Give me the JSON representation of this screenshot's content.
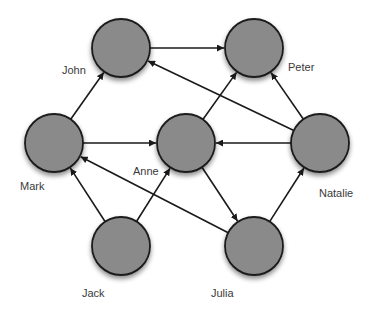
{
  "diagram": {
    "type": "directed-graph",
    "node_radius": 29,
    "colors": {
      "node_fill": "#8a8a8a",
      "node_stroke": "#1a1a1a",
      "edge": "#1a1a1a",
      "label": "#3a3a3a",
      "background": "#ffffff"
    },
    "nodes": [
      {
        "id": "john",
        "label": "John",
        "cx": 121,
        "cy": 48,
        "lx": 62,
        "ly": 74
      },
      {
        "id": "peter",
        "label": "Peter",
        "cx": 254,
        "cy": 48,
        "lx": 288,
        "ly": 71
      },
      {
        "id": "mark",
        "label": "Mark",
        "cx": 54,
        "cy": 143,
        "lx": 20,
        "ly": 190
      },
      {
        "id": "anne",
        "label": "Anne",
        "cx": 186,
        "cy": 143,
        "lx": 133,
        "ly": 175
      },
      {
        "id": "natalie",
        "label": "Natalie",
        "cx": 320,
        "cy": 143,
        "lx": 319,
        "ly": 197
      },
      {
        "id": "jack",
        "label": "Jack",
        "cx": 121,
        "cy": 246,
        "lx": 82,
        "ly": 297
      },
      {
        "id": "julia",
        "label": "Julia",
        "cx": 254,
        "cy": 246,
        "lx": 211,
        "ly": 297
      }
    ],
    "edges": [
      {
        "from": "john",
        "to": "peter"
      },
      {
        "from": "natalie",
        "to": "john"
      },
      {
        "from": "mark",
        "to": "john"
      },
      {
        "from": "mark",
        "to": "anne"
      },
      {
        "from": "anne",
        "to": "peter"
      },
      {
        "from": "natalie",
        "to": "peter"
      },
      {
        "from": "natalie",
        "to": "anne"
      },
      {
        "from": "jack",
        "to": "mark"
      },
      {
        "from": "jack",
        "to": "anne"
      },
      {
        "from": "anne",
        "to": "julia"
      },
      {
        "from": "julia",
        "to": "mark"
      },
      {
        "from": "julia",
        "to": "natalie"
      }
    ]
  }
}
